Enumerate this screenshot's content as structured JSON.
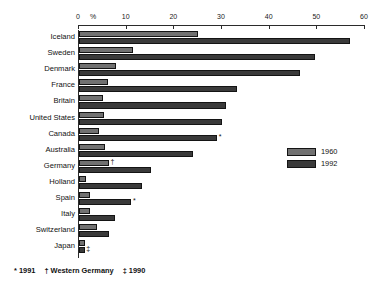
{
  "chart_data": {
    "type": "bar",
    "orientation": "horizontal",
    "title": "",
    "subtitle": "",
    "xlabel": "%",
    "ylabel": "",
    "xlim": [
      0,
      60
    ],
    "xticks": [
      0,
      10,
      20,
      30,
      40,
      50,
      60
    ],
    "xtick_labels": [
      "0",
      "10",
      "20",
      "30",
      "40",
      "50",
      "60"
    ],
    "grid": false,
    "legend_position": "right",
    "categories": [
      "Iceland",
      "Sweden",
      "Denmark",
      "France",
      "Britain",
      "United States",
      "Canada",
      "Australia",
      "Germany",
      "Holland",
      "Spain",
      "Italy",
      "Switzerland",
      "Japan"
    ],
    "series": [
      {
        "name": "1960",
        "color": "#717171",
        "values": [
          25.0,
          11.4,
          7.8,
          6.0,
          5.0,
          5.2,
          4.2,
          5.4,
          6.3,
          1.4,
          2.3,
          2.4,
          3.8,
          1.2
        ]
      },
      {
        "name": "1992",
        "color": "#3a3a3a",
        "values": [
          56.8,
          49.5,
          46.4,
          33.2,
          30.8,
          30.1,
          29.0,
          24.0,
          15.1,
          13.2,
          11.0,
          7.6,
          6.3,
          1.2
        ]
      }
    ],
    "annotations": [
      {
        "category": "Canada",
        "series": "1992",
        "marker": "*"
      },
      {
        "category": "Germany",
        "series": "1960",
        "marker": "†"
      },
      {
        "category": "Spain",
        "series": "1992",
        "marker": "*"
      },
      {
        "category": "Japan",
        "series": "1992",
        "marker": "‡"
      }
    ]
  },
  "axis": {
    "percent_symbol": "%"
  },
  "legend": {
    "items": [
      {
        "label": "1960",
        "color": "#717171"
      },
      {
        "label": "1992",
        "color": "#3a3a3a"
      }
    ]
  },
  "footnote": {
    "parts": [
      "* 1991",
      "† Western Germany",
      "‡ 1990"
    ]
  }
}
